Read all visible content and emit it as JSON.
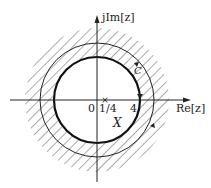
{
  "diagram": {
    "axes": {
      "imag_label": "jIm[z]",
      "real_label": "Re[z]"
    },
    "labels": {
      "origin": "0",
      "pole_inner": "1/4",
      "pole_outer": "4",
      "contour": "C",
      "region": "X"
    },
    "markers": [
      {
        "name": "pole-1-4",
        "symbol": "×",
        "value": "1/4"
      },
      {
        "name": "pole-4",
        "symbol": "×",
        "value": "4"
      }
    ],
    "colors": {
      "stroke": "#222222",
      "hatch": "#444444",
      "background": "#ffffff"
    }
  }
}
